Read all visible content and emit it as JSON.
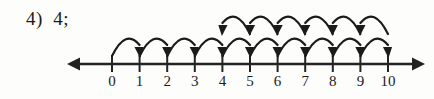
{
  "answer": {
    "item_number": "4)",
    "value": "4;",
    "full_text": "4)  4;"
  },
  "colors": {
    "ink": "#1b1b1b",
    "paper": "#fdfdfc",
    "axis": "#232323"
  },
  "chart_data": {
    "type": "numberline",
    "title": "",
    "xlabel": "",
    "ylabel": "",
    "axis": {
      "min_tick": 0,
      "max_tick": 10,
      "tick_labels": [
        "0",
        "1",
        "2",
        "3",
        "4",
        "5",
        "6",
        "7",
        "8",
        "9",
        "10"
      ],
      "tick_values": [
        0,
        1,
        2,
        3,
        4,
        5,
        6,
        7,
        8,
        9,
        10
      ],
      "left_arrow": true,
      "right_arrow": true,
      "grid": false
    },
    "hop_rows": [
      {
        "name": "forward-hops",
        "position": "below-upper",
        "direction": "right",
        "count": 10,
        "hops": [
          {
            "from": 0,
            "to": 1
          },
          {
            "from": 1,
            "to": 2
          },
          {
            "from": 2,
            "to": 3
          },
          {
            "from": 3,
            "to": 4
          },
          {
            "from": 4,
            "to": 5
          },
          {
            "from": 5,
            "to": 6
          },
          {
            "from": 6,
            "to": 7
          },
          {
            "from": 7,
            "to": 8
          },
          {
            "from": 8,
            "to": 9
          },
          {
            "from": 9,
            "to": 10
          }
        ]
      },
      {
        "name": "backward-hops",
        "position": "top",
        "direction": "left",
        "count": 6,
        "hops": [
          {
            "from": 10,
            "to": 9
          },
          {
            "from": 9,
            "to": 8
          },
          {
            "from": 8,
            "to": 7
          },
          {
            "from": 7,
            "to": 6
          },
          {
            "from": 6,
            "to": 5
          },
          {
            "from": 5,
            "to": 4
          }
        ]
      }
    ]
  },
  "geometry": {
    "origin_x": 112,
    "spacing": 27.6,
    "axis_y": 64,
    "lower_arc_top": 34,
    "upper_arc_top": 12,
    "left_arrow_tip": 67,
    "right_arrow_tip": 425,
    "label_y": 86
  }
}
